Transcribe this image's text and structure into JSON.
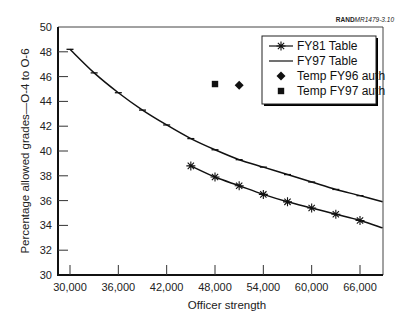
{
  "credit": {
    "bold": "RAND",
    "rest": "MR1479-3.10"
  },
  "chart_data": {
    "type": "line",
    "title": "",
    "xlabel": "Officer strength",
    "ylabel": "Percentage allowed grades—O-4 to O-6",
    "xlim": [
      28500,
      68800
    ],
    "ylim": [
      30,
      50
    ],
    "xticks": [
      30000,
      36000,
      42000,
      48000,
      54000,
      60000,
      66000
    ],
    "xtick_labels": [
      "30,000",
      "36,000",
      "42,000",
      "48,000",
      "54,000",
      "60,000",
      "66,000"
    ],
    "yticks": [
      30,
      32,
      34,
      36,
      38,
      40,
      42,
      44,
      46,
      48,
      50
    ],
    "ytick_labels": [
      "30",
      "32",
      "34",
      "36",
      "38",
      "40",
      "42",
      "44",
      "46",
      "48",
      "50"
    ],
    "grid": false,
    "legend_position": "upper right",
    "series": [
      {
        "name": "FY81 Table",
        "marker": "asterisk",
        "x": [
          45000,
          48000,
          51000,
          54000,
          57000,
          60000,
          63000,
          66000,
          68800
        ],
        "y": [
          38.8,
          37.9,
          37.2,
          36.5,
          35.9,
          35.4,
          34.9,
          34.4,
          33.8
        ],
        "marked": [
          true,
          true,
          true,
          true,
          true,
          true,
          true,
          true,
          false
        ]
      },
      {
        "name": "FY97 Table",
        "marker": "dash",
        "x": [
          30000,
          33000,
          36000,
          39000,
          42000,
          45000,
          48000,
          51000,
          54000,
          57000,
          60000,
          63000,
          66000,
          68800
        ],
        "y": [
          48.2,
          46.3,
          44.7,
          43.3,
          42.1,
          41.0,
          40.1,
          39.3,
          38.7,
          38.1,
          37.5,
          36.9,
          36.4,
          35.9
        ],
        "marked": [
          true,
          true,
          true,
          true,
          true,
          true,
          true,
          true,
          true,
          true,
          true,
          true,
          true,
          false
        ]
      },
      {
        "name": "Temp FY96 auth",
        "marker": "diamond",
        "x": [
          51000
        ],
        "y": [
          45.3
        ]
      },
      {
        "name": "Temp FY97 auth",
        "marker": "square",
        "x": [
          48000
        ],
        "y": [
          45.4
        ]
      }
    ]
  }
}
